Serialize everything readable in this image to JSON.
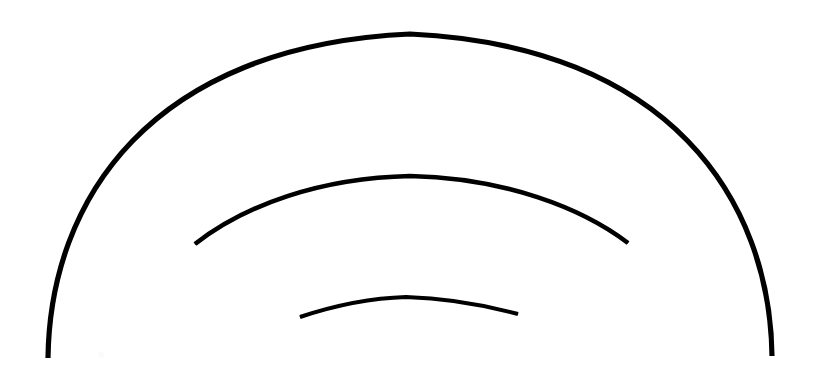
{
  "figure": {
    "canvas": {
      "width": 819,
      "height": 388,
      "background_color": "#ffffff"
    },
    "stroke_color": "#000000",
    "arcs": [
      {
        "name": "outer-arc",
        "label": "Outer arc",
        "left_end_x": 48,
        "left_end_y": 358,
        "right_end_x": 772,
        "right_end_y": 356,
        "apex_x": 410,
        "apex_y": 34,
        "stroke_width": 5.2,
        "taper_stroke_width": 4.0,
        "path": "M 48 358 C 50 200 150 46 410 34 C 670 46 770 200 772 356"
      },
      {
        "name": "middle-arc",
        "label": "Middle arc",
        "left_end_x": 195,
        "left_end_y": 244,
        "right_end_x": 628,
        "right_end_y": 243,
        "apex_x": 410,
        "apex_y": 176,
        "stroke_width": 4.6,
        "taper_stroke_width": 1.2,
        "path": "M 195 244 C 245 205 320 178 410 176 C 505 178 582 208 628 243"
      },
      {
        "name": "inner-arc",
        "label": "Inner arc",
        "left_end_x": 300,
        "left_end_y": 317,
        "right_end_x": 518,
        "right_end_y": 314,
        "apex_x": 406,
        "apex_y": 297,
        "stroke_width": 4.0,
        "taper_stroke_width": 0.8,
        "path": "M 300 317 C 336 305 372 298 406 297 C 444 298 484 305 518 314"
      }
    ],
    "specks": [
      {
        "name": "speck-left",
        "x": 98,
        "y": 352
      }
    ]
  }
}
